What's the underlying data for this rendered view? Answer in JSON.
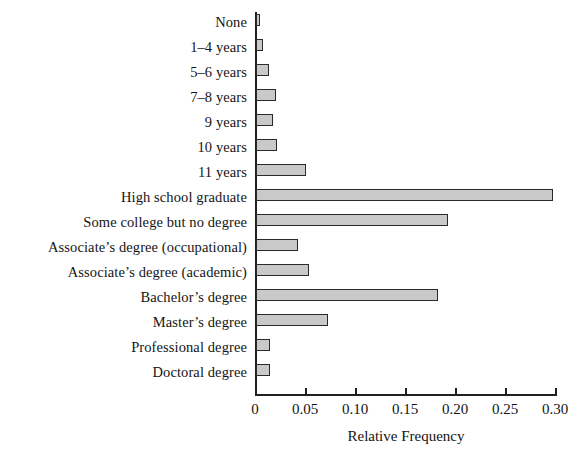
{
  "chart_data": {
    "type": "bar",
    "orientation": "horizontal",
    "title": "",
    "xlabel": "Relative Frequency",
    "ylabel": "",
    "xlim": [
      0,
      0.3
    ],
    "xticks": [
      0,
      0.05,
      0.1,
      0.15,
      0.2,
      0.25,
      0.3
    ],
    "xtick_labels": [
      "0",
      "0.05",
      "0.10",
      "0.15",
      "0.20",
      "0.25",
      "0.30"
    ],
    "grid": false,
    "legend": null,
    "bar_fill_color": "#c9c9c9",
    "bar_edge_color": "#2a2a2a",
    "background_color": "#ffffff",
    "categories": [
      "None",
      "1–4 years",
      "5–6 years",
      "7–8 years",
      "9 years",
      "10 years",
      "11 years",
      "High school graduate",
      "Some college but no degree",
      "Associate’s degree (occupational)",
      "Associate’s degree (academic)",
      "Bachelor’s degree",
      "Master’s degree",
      "Professional degree",
      "Doctoral degree"
    ],
    "values": [
      0.004,
      0.007,
      0.013,
      0.02,
      0.017,
      0.021,
      0.05,
      0.297,
      0.192,
      0.042,
      0.053,
      0.182,
      0.072,
      0.014,
      0.014
    ]
  }
}
